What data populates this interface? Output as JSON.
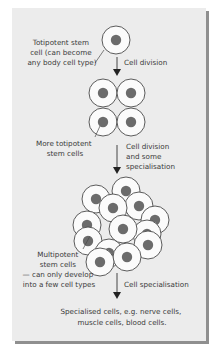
{
  "diagram": {
    "colors": {
      "panel": "#ececec",
      "shadow": "#8f8f8f",
      "cell_fill": "#fbfbfb",
      "cell_stroke": "#4a4a4a",
      "nucleus": "#6b6b6b",
      "text": "#3a3a3a",
      "arrow": "#333333"
    },
    "labels": {
      "totipotent": [
        "Totipotent stem",
        "cell (can become",
        "any body cell type)"
      ],
      "more_totipotent": [
        "More totipotent",
        "stem cells"
      ],
      "multipotent": [
        "Multipotent",
        "stem cells",
        "— can only develop",
        "into a few cell types"
      ],
      "specialised": [
        "Specialised cells, e.g. nerve cells,",
        "muscle cells, blood cells."
      ]
    },
    "arrows": {
      "step1": [
        "Cell division"
      ],
      "step2": [
        "Cell division",
        "and some",
        "specialisation"
      ],
      "step3": [
        "Cell specialisation"
      ]
    }
  }
}
